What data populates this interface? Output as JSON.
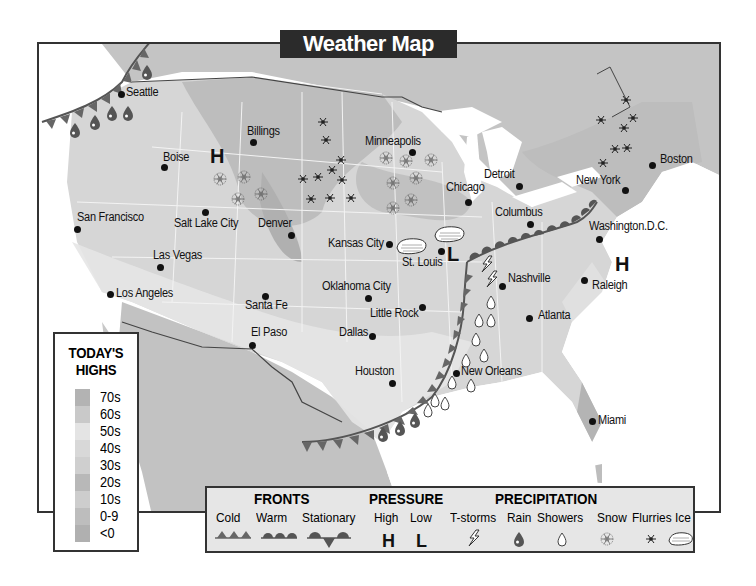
{
  "title": "Weather Map",
  "cities": [
    {
      "name": "Seattle",
      "x": 121,
      "y": 94,
      "lx": 126,
      "ly": 85
    },
    {
      "name": "Billings",
      "x": 253,
      "y": 142,
      "lx": 247,
      "ly": 124
    },
    {
      "name": "Boise",
      "x": 164,
      "y": 167,
      "lx": 163,
      "ly": 150
    },
    {
      "name": "Minneapolis",
      "x": 412,
      "y": 152,
      "lx": 365,
      "ly": 134
    },
    {
      "name": "Detroit",
      "x": 519,
      "y": 186,
      "lx": 484,
      "ly": 167
    },
    {
      "name": "Chicago",
      "x": 468,
      "y": 202,
      "lx": 446,
      "ly": 180
    },
    {
      "name": "Boston",
      "x": 652,
      "y": 165,
      "lx": 660,
      "ly": 152
    },
    {
      "name": "New York",
      "x": 625,
      "y": 190,
      "lx": 576,
      "ly": 173
    },
    {
      "name": "San Francisco",
      "x": 77,
      "y": 229,
      "lx": 77,
      "ly": 210
    },
    {
      "name": "Salt Lake City",
      "x": 205,
      "y": 212,
      "lx": 174,
      "ly": 216
    },
    {
      "name": "Denver",
      "x": 291,
      "y": 235,
      "lx": 258,
      "ly": 216
    },
    {
      "name": "Columbus",
      "x": 530,
      "y": 224,
      "lx": 495,
      "ly": 205
    },
    {
      "name": "Washington.D.C.",
      "x": 599,
      "y": 239,
      "lx": 589,
      "ly": 219
    },
    {
      "name": "Kansas City",
      "x": 389,
      "y": 244,
      "lx": 328,
      "ly": 236
    },
    {
      "name": "St. Louis",
      "x": 441,
      "y": 251,
      "lx": 402,
      "ly": 255
    },
    {
      "name": "Las Vegas",
      "x": 160,
      "y": 267,
      "lx": 153,
      "ly": 248
    },
    {
      "name": "Nashville",
      "x": 502,
      "y": 286,
      "lx": 508,
      "ly": 271
    },
    {
      "name": "Raleigh",
      "x": 584,
      "y": 280,
      "lx": 592,
      "ly": 278
    },
    {
      "name": "Los Angeles",
      "x": 110,
      "y": 294,
      "lx": 116,
      "ly": 286
    },
    {
      "name": "Santa Fe",
      "x": 265,
      "y": 296,
      "lx": 245,
      "ly": 298
    },
    {
      "name": "Oklahoma City",
      "x": 368,
      "y": 298,
      "lx": 322,
      "ly": 279
    },
    {
      "name": "Little Rock",
      "x": 422,
      "y": 307,
      "lx": 370,
      "ly": 306
    },
    {
      "name": "Atlanta",
      "x": 529,
      "y": 318,
      "lx": 538,
      "ly": 308
    },
    {
      "name": "El Paso",
      "x": 252,
      "y": 345,
      "lx": 251,
      "ly": 325
    },
    {
      "name": "Dallas",
      "x": 372,
      "y": 336,
      "lx": 339,
      "ly": 325
    },
    {
      "name": "Houston",
      "x": 392,
      "y": 383,
      "lx": 355,
      "ly": 364
    },
    {
      "name": "New Orleans",
      "x": 456,
      "y": 373,
      "lx": 461,
      "ly": 364
    },
    {
      "name": "Miami",
      "x": 592,
      "y": 421,
      "lx": 598,
      "ly": 413
    }
  ],
  "pressure_markers": [
    {
      "type": "H",
      "x": 210,
      "y": 146
    },
    {
      "type": "L",
      "x": 447,
      "y": 244
    },
    {
      "type": "H",
      "x": 615,
      "y": 254
    }
  ],
  "highs_legend": {
    "title_line1": "TODAY'S",
    "title_line2": "HIGHS",
    "bands": [
      {
        "label": "70s",
        "color": "#b3b3b3"
      },
      {
        "label": "60s",
        "color": "#c9c9c9"
      },
      {
        "label": "50s",
        "color": "#e4e4e4"
      },
      {
        "label": "40s",
        "color": "#d8d8d8"
      },
      {
        "label": "30s",
        "color": "#cfcfcf"
      },
      {
        "label": "20s",
        "color": "#b8b8b8"
      },
      {
        "label": "10s",
        "color": "#cdcdcd"
      },
      {
        "label": "0-9",
        "color": "#bdbdbd"
      },
      {
        "label": "<0",
        "color": "#b0b0b0"
      }
    ]
  },
  "legend": {
    "fronts": {
      "heading": "FRONTS",
      "items": [
        "Cold",
        "Warm",
        "Stationary"
      ]
    },
    "pressure": {
      "heading": "PRESSURE",
      "items": [
        "High",
        "Low"
      ],
      "symbols": [
        "H",
        "L"
      ]
    },
    "precipitation": {
      "heading": "PRECIPITATION",
      "items": [
        "T-storms",
        "Rain",
        "Showers",
        "Snow",
        "Flurries",
        "Ice"
      ]
    }
  }
}
